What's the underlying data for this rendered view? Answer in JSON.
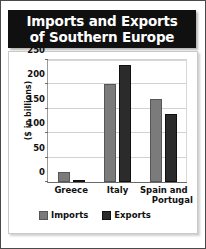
{
  "title": {
    "line1": "Imports and Exports",
    "line2": "of Southern Europe"
  },
  "colors": {
    "banner_bg": "#101010",
    "banner_text": "#ffffff",
    "imports": "#7b7b7b",
    "exports": "#2b2b2b",
    "gridline": "#d2d2d2",
    "plot_bg": "#ffffff"
  },
  "chart_data": {
    "type": "bar",
    "title": "Imports and Exports of Southern Europe",
    "xlabel": "",
    "ylabel": "($ in billions)",
    "categories": [
      "Greece",
      "Spain and Portugal",
      "Italy"
    ],
    "category_labels": [
      {
        "line1": "Greece",
        "line2": ""
      },
      {
        "line1": "Italy",
        "line2": ""
      },
      {
        "line1": "Spain and",
        "line2": "Portugal"
      }
    ],
    "categories_ordered": [
      "Greece",
      "Italy",
      "Spain and Portugal"
    ],
    "series": [
      {
        "name": "Imports",
        "values": [
          20,
          200,
          170
        ],
        "color": "#7b7b7b"
      },
      {
        "name": "Exports",
        "values": [
          5,
          240,
          140
        ],
        "color": "#2b2b2b"
      }
    ],
    "ylim": [
      0,
      250
    ],
    "yticks": [
      0,
      50,
      100,
      150,
      200,
      250
    ],
    "ytick_labels": [
      "0",
      "50",
      "100",
      "150",
      "200",
      "250"
    ],
    "grid": true,
    "legend_position": "bottom",
    "legend": [
      "Imports",
      "Exports"
    ]
  }
}
